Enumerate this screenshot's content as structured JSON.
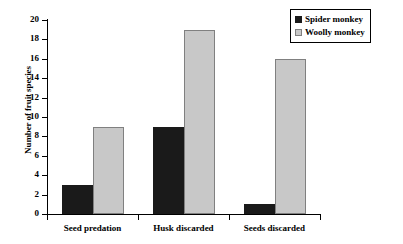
{
  "chart_data": {
    "type": "bar",
    "title": "",
    "subtitle": "",
    "xlabel": "",
    "ylabel": "Number of fruit species",
    "categories": [
      "Seed predation",
      "Husk discarded",
      "Seeds discarded"
    ],
    "series": [
      {
        "name": "Spider monkey",
        "color": "#1a1a1a",
        "values": [
          3,
          9,
          1
        ]
      },
      {
        "name": "Woolly monkey",
        "color": "#c8c8c8",
        "values": [
          9,
          19,
          16
        ]
      }
    ],
    "ylim": [
      0,
      20
    ],
    "ytick_step": 2,
    "ytick_labels": [
      "0",
      "2",
      "4",
      "6",
      "8",
      "10",
      "12",
      "14",
      "16",
      "18",
      "20"
    ],
    "grid": false,
    "legend_position": "top-right",
    "legend_entries": [
      "Spider monkey",
      "Woolly monkey"
    ],
    "annotations": []
  },
  "legend": {
    "items": [
      {
        "label": "Spider monkey"
      },
      {
        "label": "Woolly monkey"
      }
    ]
  }
}
